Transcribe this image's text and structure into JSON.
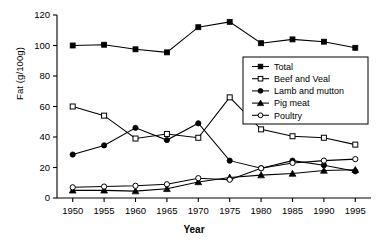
{
  "chart_data": {
    "type": "line",
    "title": "",
    "xlabel": "Year",
    "ylabel": "Fat (g/100g)",
    "x": [
      1950,
      1955,
      1960,
      1965,
      1970,
      1975,
      1980,
      1985,
      1990,
      1995
    ],
    "xtick_labels": [
      "1950",
      "1955",
      "1960",
      "1965",
      "1970",
      "1975",
      "1980",
      "1985",
      "1990",
      "1995"
    ],
    "ytick_labels": [
      "0",
      "20",
      "40",
      "60",
      "80",
      "100",
      "120"
    ],
    "yticks": [
      0,
      20,
      40,
      60,
      80,
      100,
      120
    ],
    "ylim": [
      0,
      120
    ],
    "xlim": [
      1947.5,
      1997.5
    ],
    "grid": false,
    "legend_position": "center-right",
    "series": [
      {
        "name": "Total",
        "marker": "filled-square",
        "values": [
          100,
          100.5,
          97.5,
          95.5,
          112,
          115.5,
          101.5,
          104,
          102.5,
          98.5
        ]
      },
      {
        "name": "Beef and Veal",
        "marker": "open-square",
        "values": [
          60,
          54,
          39,
          42,
          39.5,
          66,
          45,
          40.5,
          39.5,
          35
        ]
      },
      {
        "name": "Lamb and mutton",
        "marker": "filled-circle",
        "values": [
          28.5,
          34.5,
          46,
          38,
          49,
          24.5,
          19.5,
          24.5,
          21.5,
          17.5
        ]
      },
      {
        "name": "Pig meat",
        "marker": "filled-triangle",
        "values": [
          5,
          5,
          4.5,
          6,
          10.5,
          13.5,
          15,
          16,
          18,
          18.5
        ]
      },
      {
        "name": "Poultry",
        "marker": "open-circle",
        "values": [
          7,
          7.5,
          8,
          9,
          13,
          12,
          19.5,
          23,
          24.5,
          25.5
        ]
      }
    ]
  },
  "axis": {
    "y_title": "Fat (g/100g)",
    "x_title": "Year"
  },
  "legend": {
    "items": [
      {
        "label": "Total"
      },
      {
        "label": "Beef and Veal"
      },
      {
        "label": "Lamb and mutton"
      },
      {
        "label": "Pig meat"
      },
      {
        "label": "Poultry"
      }
    ]
  },
  "colors": {
    "line": "#000000",
    "axis": "#000000",
    "background": "#ffffff",
    "marker_fill_open": "#ffffff"
  }
}
